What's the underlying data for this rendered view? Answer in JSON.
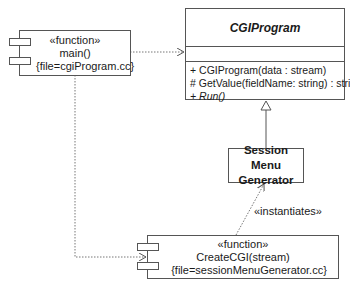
{
  "diagram": {
    "type": "UML class/component diagram",
    "main_component": {
      "stereotype": "«function»",
      "name": "main()",
      "property": "{file=cgiProgram.cc}"
    },
    "cgi_program_class": {
      "name": "CGIProgram",
      "abstract": true,
      "attributes": [],
      "operations": [
        {
          "text": "+ CGIProgram(data : stream)",
          "italic": false
        },
        {
          "text": "# GetValue(fieldName: string) : string",
          "italic": false
        },
        {
          "prefix": "+ ",
          "text": "Run()",
          "italic": true
        }
      ]
    },
    "session_class": {
      "line1": "Session Menu",
      "line2": "Generator"
    },
    "create_component": {
      "stereotype": "«function»",
      "name": "CreateCGI(stream)",
      "property": "{file=sessionMenuGenerator.cc}"
    },
    "relationships": [
      {
        "from": "main()",
        "to": "CGIProgram",
        "type": "dependency",
        "label": ""
      },
      {
        "from": "main()",
        "to": "CreateCGI(stream)",
        "type": "dependency",
        "label": ""
      },
      {
        "from": "Session Menu Generator",
        "to": "CGIProgram",
        "type": "generalization",
        "label": ""
      },
      {
        "from": "CreateCGI(stream)",
        "to": "Session Menu Generator",
        "type": "dependency",
        "label": "«instantiates»"
      }
    ],
    "instantiates_label": "«instantiates»",
    "colors": {
      "line": "#555555",
      "background": "#ffffff",
      "text": "#1a1a1a"
    }
  }
}
